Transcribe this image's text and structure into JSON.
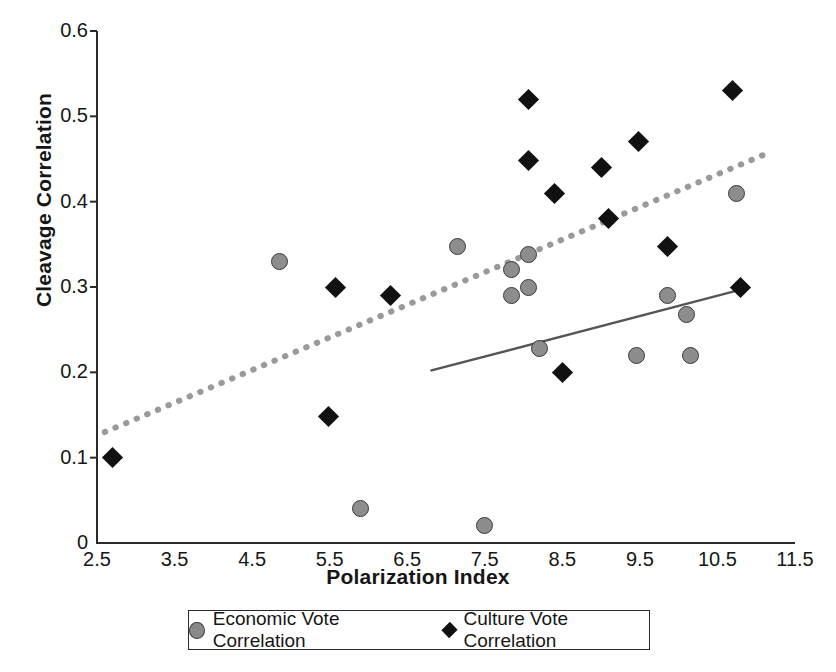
{
  "chart_data": {
    "type": "scatter",
    "title": "",
    "xlabel": "Polarization Index",
    "ylabel": "Cleavage Correlation",
    "xlim": [
      2.5,
      11.5
    ],
    "ylim": [
      0.0,
      0.6
    ],
    "xticks": [
      "2.5",
      "3.5",
      "4.5",
      "5.5",
      "6.5",
      "7.5",
      "8.5",
      "9.5",
      "10.5",
      "11.5"
    ],
    "xtick_values": [
      2.5,
      3.5,
      4.5,
      5.5,
      6.5,
      7.5,
      8.5,
      9.5,
      10.5,
      11.5
    ],
    "yticks": [
      "0",
      "0.1",
      "0.2",
      "0.3",
      "0.4",
      "0.5",
      "0.6"
    ],
    "ytick_values": [
      0,
      0.1,
      0.2,
      0.3,
      0.4,
      0.5,
      0.6
    ],
    "grid": false,
    "legend_position": "bottom",
    "series": [
      {
        "name": "Economic Vote Correlation",
        "marker": "circle",
        "color": "#8d8d8d",
        "edge_color": "#3a3a3a",
        "points": [
          [
            4.85,
            0.33
          ],
          [
            5.9,
            0.04
          ],
          [
            7.15,
            0.348
          ],
          [
            7.5,
            0.02
          ],
          [
            7.85,
            0.32
          ],
          [
            7.85,
            0.29
          ],
          [
            8.06,
            0.338
          ],
          [
            8.06,
            0.3
          ],
          [
            8.2,
            0.228
          ],
          [
            9.45,
            0.22
          ],
          [
            9.85,
            0.29
          ],
          [
            10.1,
            0.268
          ],
          [
            10.15,
            0.22
          ],
          [
            10.75,
            0.41
          ]
        ]
      },
      {
        "name": "Culture Vote Correlation",
        "marker": "diamond",
        "color": "#111111",
        "edge_color": "#111111",
        "points": [
          [
            2.7,
            0.1
          ],
          [
            5.48,
            0.148
          ],
          [
            5.58,
            0.3
          ],
          [
            6.28,
            0.29
          ],
          [
            8.06,
            0.52
          ],
          [
            8.06,
            0.448
          ],
          [
            8.4,
            0.41
          ],
          [
            8.5,
            0.2
          ],
          [
            9.0,
            0.44
          ],
          [
            9.1,
            0.38
          ],
          [
            9.48,
            0.47
          ],
          [
            9.85,
            0.348
          ],
          [
            10.7,
            0.53
          ],
          [
            10.8,
            0.3
          ]
        ]
      }
    ],
    "trendlines": [
      {
        "name": "culture-trendline",
        "style": "dotted",
        "color": "#9a9a9a",
        "x0": 2.6,
        "y0": 0.13,
        "x1": 11.1,
        "y1": 0.455
      },
      {
        "name": "economic-trendline",
        "style": "solid",
        "color": "#555555",
        "x0": 6.8,
        "y0": 0.202,
        "x1": 10.85,
        "y1": 0.298
      }
    ],
    "axis_color": "#2a2a2a"
  },
  "legend": {
    "items": [
      {
        "label": "Economic Vote Correlation",
        "marker": "circle"
      },
      {
        "label": "Culture Vote Correlation",
        "marker": "diamond"
      }
    ]
  }
}
